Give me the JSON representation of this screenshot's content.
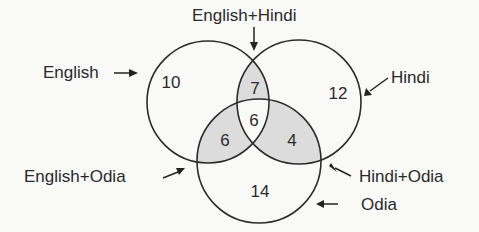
{
  "diagram": {
    "type": "venn",
    "sets": [
      {
        "name": "English",
        "label": "English"
      },
      {
        "name": "Hindi",
        "label": "Hindi"
      },
      {
        "name": "Odia",
        "label": "Odia"
      }
    ],
    "regions": {
      "english_only": "10",
      "hindi_only": "12",
      "odia_only": "14",
      "english_hindi": "7",
      "english_odia": "6",
      "hindi_odia": "4",
      "all_three": "6"
    },
    "labels": {
      "english": "English",
      "hindi": "Hindi",
      "odia": "Odia",
      "english_hindi": "English+Hindi",
      "english_odia": "English+Odia",
      "hindi_odia": "Hindi+Odia"
    },
    "colors": {
      "shaded_overlap": "#dcdcdc",
      "outline": "#2b2b2b",
      "background": "#f9f9f8"
    }
  }
}
